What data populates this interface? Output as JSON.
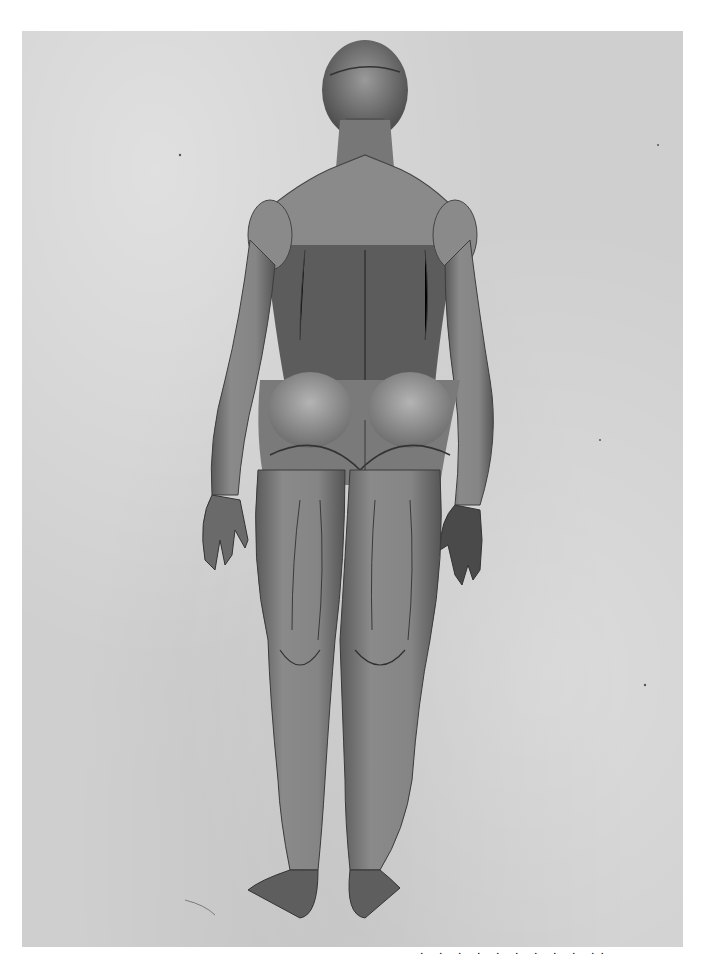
{
  "image": {
    "subject": "anatomical-plate",
    "description": "Posterior view of a standing human figure with superficial muscles exposed (écorché), engraving on grey paper",
    "view": "back"
  },
  "plate": {
    "paper_color": "#cfcfcf",
    "ink_color": "#3a3a3a",
    "background_color": "#ffffff"
  },
  "caption": {
    "text": "· · ·   · ·  ·  · ·    · ··",
    "visible": "partially cut off at bottom edge"
  }
}
